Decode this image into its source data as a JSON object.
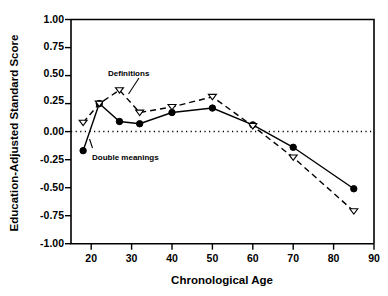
{
  "chart_data": {
    "type": "line",
    "title": "",
    "xlabel": "Chronological Age",
    "ylabel": "Education-Adjusted Standard Score",
    "xlim": [
      15,
      90
    ],
    "ylim": [
      -1.0,
      1.0
    ],
    "xticks": [
      20,
      30,
      40,
      50,
      60,
      70,
      80,
      90
    ],
    "xtick_labels": [
      "20",
      "30",
      "40",
      "50",
      "60",
      "70",
      "80",
      "90"
    ],
    "yticks": [
      -1.0,
      -0.75,
      -0.5,
      -0.25,
      0.0,
      0.25,
      0.5,
      0.75,
      1.0
    ],
    "ytick_labels": [
      "-1.00",
      "-0.75",
      "-0.50",
      "-0.25",
      "0.00",
      "0.25",
      "0.50",
      "0.75",
      "1.00"
    ],
    "grid": false,
    "legend_position": "inline-annotation",
    "reference_lines": [
      {
        "axis": "y",
        "value": 0.0,
        "style": "dotted"
      }
    ],
    "series": [
      {
        "name": "Definitions",
        "marker": "open-triangle-down",
        "line_style": "dashed",
        "x": [
          18,
          22,
          27,
          32,
          40,
          50,
          60,
          70,
          85
        ],
        "values": [
          0.08,
          0.25,
          0.37,
          0.17,
          0.22,
          0.31,
          0.05,
          -0.23,
          -0.71
        ]
      },
      {
        "name": "Double meanings",
        "marker": "filled-circle",
        "line_style": "solid",
        "x": [
          18,
          22,
          27,
          32,
          40,
          50,
          60,
          70,
          85
        ],
        "values": [
          -0.17,
          0.25,
          0.09,
          0.07,
          0.17,
          0.21,
          0.06,
          -0.14,
          -0.51
        ]
      }
    ],
    "annotations": [
      {
        "text": "Definitions",
        "x": 29,
        "y": 0.52,
        "points_to": {
          "x": 32,
          "y": 0.17
        }
      },
      {
        "text": "Double meanings",
        "x": 25,
        "y": -0.3,
        "points_to": {
          "x": 18,
          "y": -0.17
        }
      }
    ]
  },
  "colors": {
    "background": "#ffffff",
    "ink": "#000000",
    "marker_fill_open": "#ffffff"
  }
}
